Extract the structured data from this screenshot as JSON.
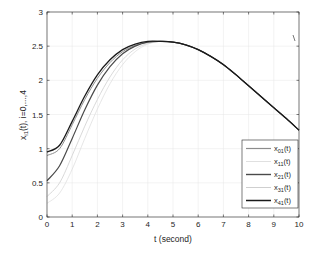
{
  "chart_data": {
    "type": "line",
    "title": "",
    "xlabel": "t (second)",
    "ylabel": "x_{i1}(t), i=0,...,4",
    "xlim": [
      0,
      10
    ],
    "ylim": [
      0,
      3
    ],
    "grid": true,
    "legend_position": "lower right",
    "xticks": [
      0,
      1,
      2,
      3,
      4,
      5,
      6,
      7,
      8,
      9,
      10
    ],
    "yticks": [
      0,
      0.5,
      1,
      1.5,
      2,
      2.5,
      3
    ],
    "x": [
      0,
      0.5,
      1,
      1.5,
      2,
      2.5,
      3,
      3.5,
      4,
      4.5,
      5,
      5.5,
      6,
      6.5,
      7,
      7.5,
      8,
      8.5,
      9,
      9.5,
      10
    ],
    "series": [
      {
        "name": "x01(t)",
        "color": "#8c8c8c",
        "width": 1.0,
        "values": [
          0.9,
          1.0,
          1.35,
          1.72,
          2.03,
          2.26,
          2.42,
          2.51,
          2.56,
          2.57,
          2.56,
          2.52,
          2.45,
          2.35,
          2.23,
          2.08,
          1.92,
          1.76,
          1.6,
          1.44,
          1.27
        ]
      },
      {
        "name": "x11(t)",
        "color": "#e0e0e0",
        "width": 0.8,
        "values": [
          0.2,
          0.35,
          0.7,
          1.15,
          1.58,
          1.95,
          2.23,
          2.42,
          2.53,
          2.57,
          2.56,
          2.52,
          2.45,
          2.35,
          2.23,
          2.08,
          1.92,
          1.76,
          1.6,
          1.44,
          1.27
        ]
      },
      {
        "name": "x21(t)",
        "color": "#4a4a4a",
        "width": 1.2,
        "values": [
          0.53,
          0.75,
          1.15,
          1.57,
          1.93,
          2.2,
          2.39,
          2.5,
          2.56,
          2.57,
          2.56,
          2.52,
          2.45,
          2.35,
          2.23,
          2.08,
          1.92,
          1.76,
          1.6,
          1.44,
          1.27
        ]
      },
      {
        "name": "x31(t)",
        "color": "#cfcfcf",
        "width": 0.8,
        "values": [
          0.3,
          0.5,
          0.9,
          1.33,
          1.72,
          2.05,
          2.3,
          2.46,
          2.54,
          2.57,
          2.56,
          2.52,
          2.45,
          2.35,
          2.23,
          2.08,
          1.92,
          1.76,
          1.6,
          1.44,
          1.27
        ]
      },
      {
        "name": "x41(t)",
        "color": "#1a1a1a",
        "width": 1.3,
        "values": [
          0.95,
          1.05,
          1.4,
          1.77,
          2.08,
          2.3,
          2.45,
          2.53,
          2.57,
          2.57,
          2.56,
          2.52,
          2.45,
          2.35,
          2.23,
          2.08,
          1.92,
          1.76,
          1.6,
          1.44,
          1.27
        ]
      }
    ]
  },
  "legend": {
    "items": [
      {
        "base": "x",
        "sub": "01",
        "suffix": "(t)"
      },
      {
        "base": "x",
        "sub": "11",
        "suffix": "(t)"
      },
      {
        "base": "x",
        "sub": "21",
        "suffix": "(t)"
      },
      {
        "base": "x",
        "sub": "31",
        "suffix": "(t)"
      },
      {
        "base": "x",
        "sub": "41",
        "suffix": "(t)"
      }
    ]
  },
  "labels": {
    "x_axis": "t (second)",
    "y_axis_base": "x",
    "y_axis_sub": "i1",
    "y_axis_rest": "(t), i=0,...,4"
  }
}
